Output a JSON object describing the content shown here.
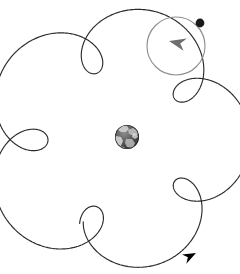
{
  "figure": {
    "title": "Spacecraft spiral transfer trajectory around Earth",
    "type": "orbital-trajectory-diagram",
    "width": 240,
    "height": 274,
    "background_color": "#ffffff"
  },
  "colors": {
    "trajectory_stroke": "#2b2b2b",
    "capture_orbit_stroke": "#8c8c8c",
    "direction_arrow_primary": "#000000",
    "direction_arrow_secondary": "#6e6e6e",
    "spacecraft_marker": "#1a1a1a",
    "earth_ocean": "#4a4a4a",
    "earth_land": "#d9d9d9",
    "background": "#ffffff"
  },
  "central_body": {
    "name": "earth-globe",
    "label": "Earth",
    "center_x": 127,
    "center_y": 137,
    "radius": 12
  },
  "capture_orbit": {
    "name": "capture-orbit-circle",
    "label": "Final circular orbit",
    "center_x": 176,
    "center_y": 46,
    "radius": 29,
    "stroke_width": 1.1
  },
  "spacecraft_marker": {
    "name": "spacecraft-dot",
    "label": "Spacecraft",
    "center_x": 200,
    "center_y": 23,
    "radius": 4.4
  },
  "arrows": [
    {
      "name": "direction-arrow-start",
      "label": "Departure direction",
      "x": 196,
      "y": 253,
      "angle_deg": -28,
      "scale": 1.0,
      "color_key": "direction_arrow_primary"
    },
    {
      "name": "direction-arrow-capture",
      "label": "Capture direction",
      "x": 169,
      "y": 41,
      "angle_deg": 192,
      "scale": 1.25,
      "color_key": "direction_arrow_secondary"
    }
  ],
  "chart_data": {
    "type": "line",
    "title": "Spacecraft spiral transfer trajectory around Earth",
    "xlabel": "",
    "ylabel": "",
    "xlim": [
      0,
      240
    ],
    "ylim": [
      0,
      274
    ],
    "grid": false,
    "legend": null,
    "annotations": [
      "Earth at center",
      "Spacecraft marker on final circular orbit",
      "Arrowheads indicate direction of motion"
    ],
    "series": [
      {
        "name": "spiral-trajectory",
        "curve_type": "epitrochoid-spiral",
        "center": [
          118,
          140
        ],
        "loops": 6,
        "t_start": 0.0,
        "t_end": 6.283185307179586,
        "samples": 1400,
        "big_radius_start": 104,
        "big_radius_end": 100,
        "loop_radius_start": 34,
        "loop_radius_end": 30,
        "phase_deg": 96
      },
      {
        "name": "capture-orbit",
        "curve_type": "circle",
        "center": [
          176,
          46
        ],
        "radius": 29
      }
    ]
  }
}
